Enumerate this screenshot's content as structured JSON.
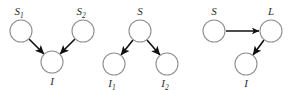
{
  "figure": {
    "background_color": "#ffffff",
    "node_stroke_color": "#8f8f8f",
    "edge_color": "#111111",
    "label_color": "#2b2b2b",
    "node_radius": 11,
    "panels": [
      {
        "id": "panel-common-effect",
        "name": "collider-structure",
        "nodes": [
          {
            "id": "s1",
            "label": "S",
            "subscript": "1",
            "cx": 21,
            "cy": 31,
            "label_x": 21,
            "label_y": 15
          },
          {
            "id": "s2",
            "label": "S",
            "subscript": "2",
            "cx": 83,
            "cy": 31,
            "label_x": 83,
            "label_y": 15
          },
          {
            "id": "i",
            "label": "I",
            "subscript": "",
            "cx": 52,
            "cy": 62,
            "label_x": 52,
            "label_y": 85
          }
        ],
        "edges": [
          {
            "from": "s1",
            "to": "i",
            "x1": 29,
            "y1": 39,
            "x2": 44,
            "y2": 54
          },
          {
            "from": "s2",
            "to": "i",
            "x1": 75,
            "y1": 39,
            "x2": 60,
            "y2": 54
          }
        ]
      },
      {
        "id": "panel-common-cause",
        "name": "fork-structure",
        "nodes": [
          {
            "id": "s",
            "label": "S",
            "subscript": "",
            "cx": 140,
            "cy": 31,
            "label_x": 140,
            "label_y": 15
          },
          {
            "id": "i1",
            "label": "I",
            "subscript": "1",
            "cx": 114,
            "cy": 64,
            "label_x": 114,
            "label_y": 87
          },
          {
            "id": "i2",
            "label": "I",
            "subscript": "2",
            "cx": 167,
            "cy": 64,
            "label_x": 167,
            "label_y": 87
          }
        ],
        "edges": [
          {
            "from": "s",
            "to": "i1",
            "x1": 133,
            "y1": 40,
            "x2": 121,
            "y2": 55
          },
          {
            "from": "s",
            "to": "i2",
            "x1": 147,
            "y1": 40,
            "x2": 160,
            "y2": 55
          }
        ]
      },
      {
        "id": "panel-chain",
        "name": "chain-structure",
        "nodes": [
          {
            "id": "s",
            "label": "S",
            "subscript": "",
            "cx": 214,
            "cy": 31,
            "label_x": 214,
            "label_y": 15
          },
          {
            "id": "l",
            "label": "L",
            "subscript": "",
            "cx": 271,
            "cy": 31,
            "label_x": 271,
            "label_y": 15
          },
          {
            "id": "i",
            "label": "I",
            "subscript": "",
            "cx": 246,
            "cy": 64,
            "label_x": 246,
            "label_y": 87
          }
        ],
        "edges": [
          {
            "from": "s",
            "to": "l",
            "x1": 226,
            "y1": 31,
            "x2": 259,
            "y2": 31
          },
          {
            "from": "l",
            "to": "i",
            "x1": 264,
            "y1": 40,
            "x2": 253,
            "y2": 55
          }
        ]
      }
    ]
  }
}
